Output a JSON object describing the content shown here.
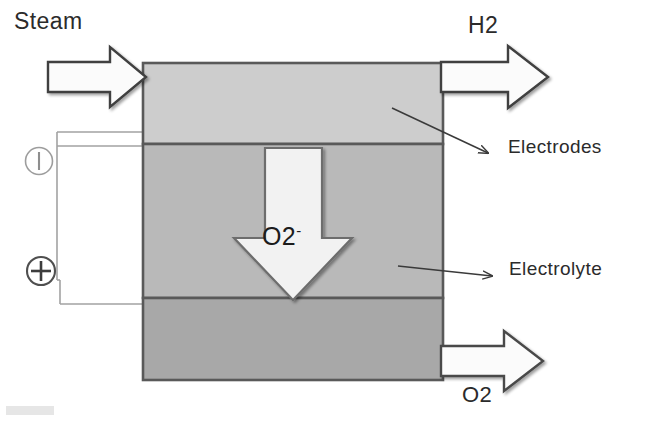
{
  "diagram": {
    "type": "process-diagram",
    "inlets": [
      {
        "id": "steam",
        "label": "Steam",
        "direction": "right",
        "side": "left-top"
      }
    ],
    "outlets": [
      {
        "id": "h2",
        "label": "H2",
        "direction": "right",
        "side": "right-top"
      },
      {
        "id": "o2",
        "label": "O2",
        "direction": "right",
        "side": "right-bottom"
      }
    ],
    "ion_flow": {
      "species": "O2",
      "charge": "-",
      "label_text": "O2",
      "charge_text": "-",
      "direction": "down"
    },
    "layers": [
      {
        "id": "top-electrode",
        "name": "Electrodes",
        "color": "#cdcdcd"
      },
      {
        "id": "electrolyte",
        "name": "Electrolyte",
        "color": "#b9b9b9"
      },
      {
        "id": "bottom-electrode",
        "name": "Electrodes",
        "color": "#a8a8a8"
      }
    ],
    "callouts": [
      {
        "id": "electrodes",
        "label": "Electrodes"
      },
      {
        "id": "electrolyte",
        "label": "Electrolyte"
      }
    ],
    "terminals": [
      {
        "id": "negative",
        "symbol": "minus",
        "glyph": "⊖"
      },
      {
        "id": "positive",
        "symbol": "plus",
        "glyph": "⊕"
      }
    ],
    "colors": {
      "outline": "#4a4a4a",
      "wire": "#9a9a9a",
      "text": "#2b2b2b",
      "arrow_fill": "#f7f7f7",
      "ion_arrow_fill": "#f2f2f2"
    }
  }
}
